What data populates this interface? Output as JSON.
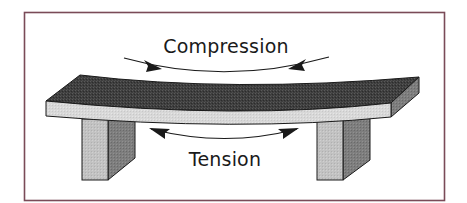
{
  "diagram": {
    "labels": {
      "compression": "Compression",
      "tension": "Tension"
    },
    "colors": {
      "frame_border": "#7a4b58",
      "beam_top": "#3c3c3c",
      "beam_front": "#d9d9d9",
      "beam_side": "#8a8a8a",
      "support_front": "#c4c4c4",
      "support_side": "#7d7d7d",
      "outline": "#1a1a1a",
      "arrow": "#1a1a1a",
      "background": "#ffffff"
    },
    "components": {
      "beam": "Horizontal beam bending downward under load",
      "supports": [
        "Left support block",
        "Right support block"
      ],
      "arrows": [
        "Compression arrows pointing inward above beam",
        "Tension arrows pointing outward below beam"
      ]
    }
  }
}
